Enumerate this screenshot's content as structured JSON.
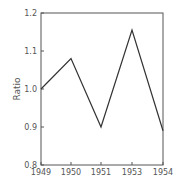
{
  "chart_data": {
    "type": "line",
    "title": "",
    "xlabel": "",
    "ylabel": "Ratio",
    "categories": [
      "1949",
      "1950",
      "1951",
      "1953",
      "1954"
    ],
    "values": [
      1.0,
      1.08,
      0.9,
      1.155,
      0.89
    ],
    "ylim": [
      0.8,
      1.2
    ],
    "yticks": [
      "0.8",
      "0.9",
      "1.0",
      "1.1",
      "1.2"
    ],
    "xticks": [
      "1949",
      "1950",
      "1951",
      "1953",
      "1954"
    ],
    "grid": false,
    "legend": null
  },
  "style": {
    "line_color": "#333333",
    "axis_color": "#555555"
  }
}
